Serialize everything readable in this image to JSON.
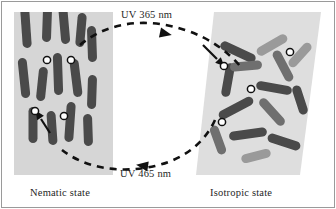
{
  "figure": {
    "border_color": "#9a9a9a",
    "background_color": "#ffffff"
  },
  "labels": {
    "uv_forward": "UV 365 nm",
    "uv_reverse": "UV 465 nm",
    "state_left": "Nematic state",
    "state_right": "Isotropic state"
  },
  "colors": {
    "panel_gray": "#d6d6d6",
    "panel_gray_light": "#dedede",
    "rod_dark": "#4a4a4a",
    "rod_mid": "#6f6f6f",
    "rod_light": "#9a9a9a",
    "marker_fill": "#ffffff",
    "marker_stroke": "#111111",
    "arrow_color": "#111111",
    "text_color": "#1f1f1f"
  },
  "chart_data": {
    "type": "diagram",
    "panels": [
      {
        "name": "nematic",
        "label": "Nematic state",
        "shape": "rectangle",
        "x": 14,
        "y": 12,
        "width": 99,
        "height": 163,
        "fill": "#d6d6d6",
        "ordering": "aligned",
        "description": "Rod-like mesogens aligned nearly parallel along the vertical director"
      },
      {
        "name": "isotropic",
        "label": "Isotropic state",
        "shape": "slanted-parallelogram",
        "points": "214,12 321,12 300,175 196,175",
        "fill": "#dedede",
        "ordering": "random",
        "description": "Rod-like mesogens randomly oriented; several bent cis-azobenzene pairs"
      }
    ],
    "arrows": [
      {
        "name": "forward-arrow",
        "label": "UV 365 nm",
        "direction": "left-to-right",
        "style": "dashed-curve",
        "path": "M 80,45 C 110,20 150,18 185,30 C 210,38 228,52 240,66",
        "arrowhead_at": [
          160,
          33
        ],
        "arrowhead_angle": 12
      },
      {
        "name": "reverse-arrow",
        "label": "UV 465 nm",
        "direction": "right-to-left",
        "style": "dashed-curve",
        "path": "M 215,120 C 205,140 185,158 155,165 C 120,173 85,168 62,150",
        "arrowhead_at": [
          148,
          166
        ],
        "arrowhead_angle": 188
      }
    ],
    "markers": {
      "name": "azobenzene-junction",
      "symbol": "white circle with black outline",
      "count_left": 4,
      "count_right": 3,
      "left_positions": [
        [
          47,
          60
        ],
        [
          71,
          60
        ],
        [
          35,
          111
        ],
        [
          64,
          116
        ]
      ],
      "right_positions": [
        [
          224,
          66
        ],
        [
          290,
          52
        ],
        [
          251,
          89
        ],
        [
          222,
          122
        ]
      ]
    },
    "pointers": [
      {
        "name": "pointer-left",
        "from": [
          48,
          131
        ],
        "to": [
          40,
          117
        ]
      },
      {
        "name": "pointer-right",
        "from": [
          203,
          45
        ],
        "to": [
          219,
          61
        ]
      }
    ],
    "rods_left": [
      {
        "x": 26,
        "y": 28,
        "len": 40,
        "w": 9,
        "angle": 86,
        "shade": "rod_dark"
      },
      {
        "x": 47,
        "y": 24,
        "len": 36,
        "w": 9,
        "angle": 92,
        "shade": "rod_dark"
      },
      {
        "x": 64,
        "y": 22,
        "len": 44,
        "w": 9,
        "angle": 85,
        "shade": "rod_dark"
      },
      {
        "x": 81,
        "y": 30,
        "len": 34,
        "w": 9,
        "angle": 95,
        "shade": "rod_dark"
      },
      {
        "x": 92,
        "y": 44,
        "len": 36,
        "w": 9,
        "angle": 88,
        "shade": "rod_dark"
      },
      {
        "x": 24,
        "y": 78,
        "len": 40,
        "w": 9,
        "angle": 84,
        "shade": "rod_dark"
      },
      {
        "x": 42,
        "y": 84,
        "len": 34,
        "w": 9,
        "angle": 96,
        "shade": "rod_dark"
      },
      {
        "x": 58,
        "y": 74,
        "len": 42,
        "w": 9,
        "angle": 88,
        "shade": "rod_dark"
      },
      {
        "x": 76,
        "y": 78,
        "len": 38,
        "w": 9,
        "angle": 83,
        "shade": "rod_dark"
      },
      {
        "x": 92,
        "y": 92,
        "len": 34,
        "w": 9,
        "angle": 92,
        "shade": "rod_dark"
      },
      {
        "x": 33,
        "y": 125,
        "len": 36,
        "w": 9,
        "angle": 90,
        "shade": "rod_dark"
      },
      {
        "x": 52,
        "y": 128,
        "len": 34,
        "w": 9,
        "angle": 86,
        "shade": "rod_dark"
      },
      {
        "x": 70,
        "y": 122,
        "len": 40,
        "w": 9,
        "angle": 94,
        "shade": "rod_dark"
      },
      {
        "x": 88,
        "y": 130,
        "len": 32,
        "w": 9,
        "angle": 88,
        "shade": "rod_dark"
      }
    ],
    "rods_right": [
      {
        "x": 238,
        "y": 52,
        "len": 38,
        "w": 9,
        "angle": 25,
        "shade": "rod_dark"
      },
      {
        "x": 228,
        "y": 80,
        "len": 34,
        "w": 9,
        "angle": 100,
        "shade": "rod_dark"
      },
      {
        "x": 246,
        "y": 66,
        "len": 32,
        "w": 9,
        "angle": -5,
        "shade": "rod_mid"
      },
      {
        "x": 272,
        "y": 45,
        "len": 34,
        "w": 9,
        "angle": -30,
        "shade": "rod_light"
      },
      {
        "x": 283,
        "y": 66,
        "len": 34,
        "w": 9,
        "angle": 62,
        "shade": "rod_mid"
      },
      {
        "x": 300,
        "y": 55,
        "len": 30,
        "w": 9,
        "angle": -48,
        "shade": "rod_light"
      },
      {
        "x": 274,
        "y": 88,
        "len": 36,
        "w": 9,
        "angle": 10,
        "shade": "rod_dark"
      },
      {
        "x": 236,
        "y": 108,
        "len": 38,
        "w": 9,
        "angle": -28,
        "shade": "rod_dark"
      },
      {
        "x": 272,
        "y": 112,
        "len": 34,
        "w": 9,
        "angle": 48,
        "shade": "rod_mid"
      },
      {
        "x": 300,
        "y": 100,
        "len": 30,
        "w": 9,
        "angle": 72,
        "shade": "rod_dark"
      },
      {
        "x": 248,
        "y": 134,
        "len": 38,
        "w": 9,
        "angle": -8,
        "shade": "rod_dark"
      },
      {
        "x": 218,
        "y": 140,
        "len": 30,
        "w": 9,
        "angle": 70,
        "shade": "rod_mid"
      },
      {
        "x": 284,
        "y": 142,
        "len": 34,
        "w": 9,
        "angle": 18,
        "shade": "rod_dark"
      },
      {
        "x": 256,
        "y": 156,
        "len": 30,
        "w": 9,
        "angle": -14,
        "shade": "rod_light"
      }
    ],
    "xlabel": "",
    "ylabel": "",
    "grid": false,
    "legend": null
  }
}
